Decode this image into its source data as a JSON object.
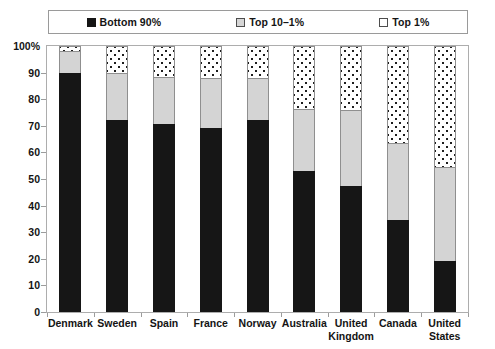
{
  "legend": {
    "position": "top",
    "entries": [
      {
        "label": "Bottom 90%",
        "swatch": "filled-black-square-icon",
        "color": "#151515"
      },
      {
        "label": "Top 10–1%",
        "swatch": "light-gray-square-icon",
        "color": "#d6d6d6"
      },
      {
        "label": "Top 1%",
        "swatch": "dotted-white-square-icon",
        "color": "#ffffff"
      }
    ]
  },
  "axes": {
    "y_tick_labels": [
      "100%",
      "90",
      "80",
      "70",
      "60",
      "50",
      "40",
      "30",
      "20",
      "10",
      "0"
    ],
    "y_label": "",
    "x_label": ""
  },
  "chart_data": {
    "type": "bar",
    "stacked": true,
    "title": "",
    "subtitle": "",
    "xlabel": "",
    "ylabel": "",
    "ylim": [
      0,
      100
    ],
    "ytick_step": 10,
    "grid": false,
    "legend_position": "top",
    "categories": [
      "Denmark",
      "Sweden",
      "Spain",
      "France",
      "Norway",
      "Australia",
      "United Kingdom",
      "Canada",
      "United States"
    ],
    "series": [
      {
        "name": "Bottom 90%",
        "color": "#161616",
        "values": [
          90,
          72,
          70.5,
          69,
          72,
          53,
          47.5,
          34.5,
          19
        ]
      },
      {
        "name": "Top 10–1%",
        "color": "#d4d4d4",
        "values": [
          8,
          18,
          18,
          19,
          16,
          23.5,
          28.5,
          29,
          35.5
        ]
      },
      {
        "name": "Top 1%",
        "color": "#ffffff",
        "values": [
          2,
          10,
          11.5,
          12,
          12,
          23.5,
          24,
          36.5,
          45.5
        ]
      }
    ]
  }
}
